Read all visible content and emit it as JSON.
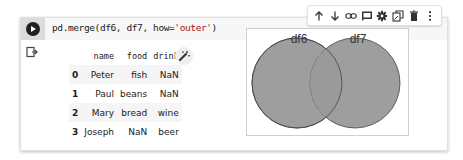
{
  "cell": {
    "code": {
      "prefix": "pd.merge(df6, df7, how=",
      "string_arg": "'outer'",
      "suffix": ")"
    },
    "run_button_icon": "play-icon",
    "toolbar": {
      "icons": [
        "arrow-up-icon",
        "arrow-down-icon",
        "link-icon",
        "comment-icon",
        "gear-icon",
        "mirror-cell-icon",
        "trash-icon",
        "more-vert-icon"
      ]
    },
    "output": {
      "output_icon": "output-arrow-icon",
      "table": {
        "columns": [
          "name",
          "food",
          "drink"
        ],
        "rows": [
          {
            "index": "0",
            "name": "Peter",
            "food": "fish",
            "drink": "NaN"
          },
          {
            "index": "1",
            "name": "Paul",
            "food": "beans",
            "drink": "NaN"
          },
          {
            "index": "2",
            "name": "Mary",
            "food": "bread",
            "drink": "wine"
          },
          {
            "index": "3",
            "name": "Joseph",
            "food": "NaN",
            "drink": "beer"
          }
        ]
      },
      "suggest_icon": "magic-wand-icon",
      "venn": {
        "left_label": "df6",
        "right_label": "df7",
        "fill_color": "#9e9e9e",
        "stroke_color": "#444444"
      }
    }
  }
}
